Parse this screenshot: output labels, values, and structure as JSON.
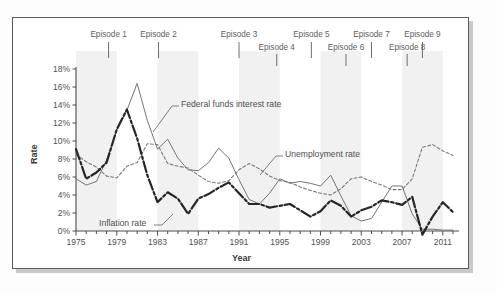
{
  "figure": {
    "background": "#ffffff",
    "frame_color": "#5b5b5b",
    "shadow_color": "#c9c9c9"
  },
  "chart_data": {
    "type": "line",
    "title": "",
    "xlabel": "Year",
    "ylabel": "Rate",
    "grid": false,
    "legend_position": "inline-annotations",
    "xlim": [
      1975,
      2012
    ],
    "ylim": [
      0,
      18
    ],
    "ytick_labels": [
      "0%",
      "2%",
      "4%",
      "6%",
      "8%",
      "10%",
      "12%",
      "14%",
      "16%",
      "18%"
    ],
    "ytick_values": [
      0,
      2,
      4,
      6,
      8,
      10,
      12,
      14,
      16,
      18
    ],
    "xtick_labels": [
      "1975",
      "1979",
      "1983",
      "1987",
      "1991",
      "1995",
      "1999",
      "2003",
      "2007",
      "2011"
    ],
    "xtick_values": [
      1975,
      1979,
      1983,
      1987,
      1991,
      1995,
      1999,
      2003,
      2007,
      2011
    ],
    "x": [
      1975,
      1976,
      1977,
      1978,
      1979,
      1980,
      1981,
      1982,
      1983,
      1984,
      1985,
      1986,
      1987,
      1988,
      1989,
      1990,
      1991,
      1992,
      1993,
      1994,
      1995,
      1996,
      1997,
      1998,
      1999,
      2000,
      2001,
      2002,
      2003,
      2004,
      2005,
      2006,
      2007,
      2008,
      2009,
      2010,
      2011,
      2012
    ],
    "series": [
      {
        "name": "Federal funds interest rate",
        "style": "thin-solid",
        "color": "#6d6d6d",
        "values": [
          5.8,
          5.1,
          5.5,
          7.9,
          11.2,
          13.4,
          16.4,
          12.3,
          9.1,
          10.2,
          8.1,
          6.8,
          6.7,
          7.6,
          9.2,
          8.1,
          5.7,
          3.5,
          3.0,
          4.2,
          5.8,
          5.3,
          5.5,
          5.3,
          5.0,
          6.2,
          3.9,
          1.7,
          1.1,
          1.4,
          3.2,
          5.0,
          5.0,
          1.9,
          0.2,
          0.2,
          0.1,
          0.1
        ]
      },
      {
        "name": "Unemployment rate",
        "style": "dashed",
        "color": "#7a7a7a",
        "values": [
          8.5,
          7.7,
          7.1,
          6.1,
          5.9,
          7.2,
          7.6,
          9.7,
          9.6,
          7.5,
          7.2,
          7.0,
          6.2,
          5.5,
          5.3,
          5.6,
          6.8,
          7.5,
          6.9,
          6.1,
          5.6,
          5.4,
          4.9,
          4.5,
          4.2,
          4.0,
          4.7,
          5.8,
          6.0,
          5.5,
          5.1,
          4.6,
          4.6,
          5.8,
          9.3,
          9.6,
          8.9,
          8.4
        ]
      },
      {
        "name": "Inflation rate",
        "style": "thick-dashdot",
        "color": "#262626",
        "values": [
          9.1,
          5.8,
          6.5,
          7.6,
          11.3,
          13.5,
          10.3,
          6.2,
          3.2,
          4.3,
          3.6,
          1.9,
          3.6,
          4.1,
          4.8,
          5.4,
          4.2,
          3.0,
          3.0,
          2.6,
          2.8,
          3.0,
          2.3,
          1.6,
          2.2,
          3.4,
          2.8,
          1.6,
          2.3,
          2.7,
          3.4,
          3.2,
          2.9,
          3.8,
          -0.4,
          1.6,
          3.2,
          2.1
        ]
      }
    ],
    "episodes": [
      {
        "label": "Episode 1",
        "year": 1978.2,
        "row": "top"
      },
      {
        "label": "Episode 2",
        "year": 1983.1,
        "row": "top"
      },
      {
        "label": "Episode 3",
        "year": 1991.0,
        "row": "top"
      },
      {
        "label": "Episode 4",
        "year": 1994.7,
        "row": "bottom"
      },
      {
        "label": "Episode 5",
        "year": 1998.1,
        "row": "top"
      },
      {
        "label": "Episode 6",
        "year": 2001.5,
        "row": "bottom"
      },
      {
        "label": "Episode 7",
        "year": 2004.0,
        "row": "top"
      },
      {
        "label": "Episode 8",
        "year": 2007.5,
        "row": "bottom"
      },
      {
        "label": "Episode 9",
        "year": 2009.0,
        "row": "top"
      }
    ],
    "annotations": [
      {
        "text": "Federal funds interest rate",
        "target_series": "Federal funds interest rate"
      },
      {
        "text": "Unemployment rate",
        "target_series": "Unemployment rate"
      },
      {
        "text": "Inflation rate",
        "target_series": "Inflation rate"
      }
    ]
  }
}
